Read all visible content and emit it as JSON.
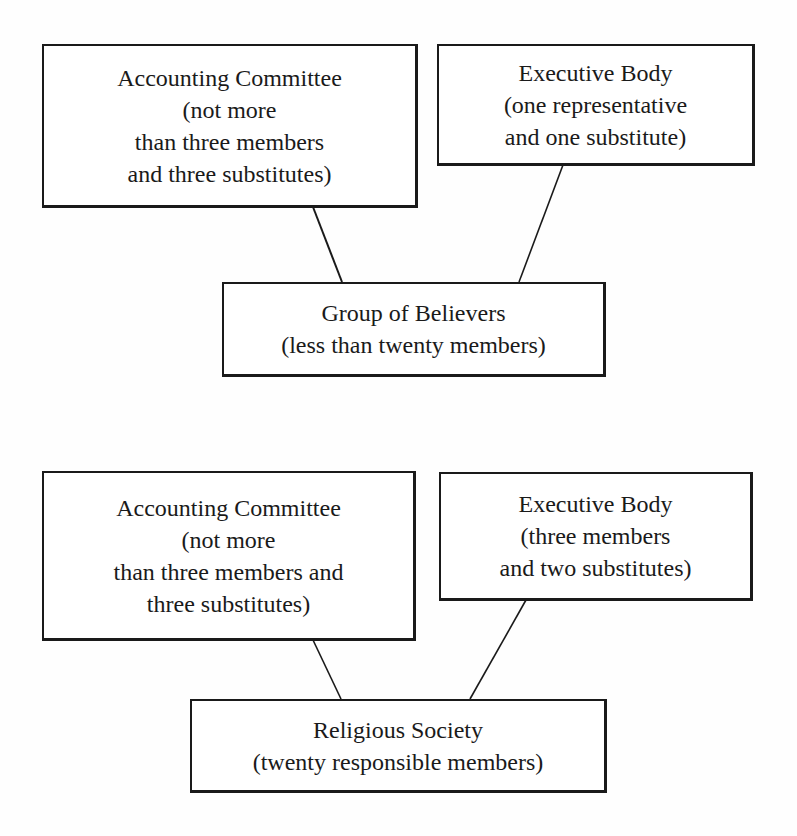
{
  "diagrams": [
    {
      "name": "Group of Believers structure",
      "nodes": {
        "accounting": {
          "title": "Accounting Committee",
          "lines": [
            "(not more",
            "than three members",
            "and three substitutes)"
          ]
        },
        "executive": {
          "title": "Executive Body",
          "lines": [
            "(one representative",
            "and one substitute)"
          ]
        },
        "root": {
          "title": "Group of Believers",
          "lines": [
            "(less than twenty members)"
          ]
        }
      },
      "edges": [
        {
          "from": "accounting",
          "to": "root"
        },
        {
          "from": "executive",
          "to": "root"
        }
      ]
    },
    {
      "name": "Religious Society structure",
      "nodes": {
        "accounting": {
          "title": "Accounting Committee",
          "lines": [
            "(not more",
            "than three members and",
            "three substitutes)"
          ]
        },
        "executive": {
          "title": "Executive Body",
          "lines": [
            "(three members",
            "and two substitutes)"
          ]
        },
        "root": {
          "title": "Religious Society",
          "lines": [
            "(twenty responsible members)"
          ]
        }
      },
      "edges": [
        {
          "from": "accounting",
          "to": "root"
        },
        {
          "from": "executive",
          "to": "root"
        }
      ]
    }
  ]
}
